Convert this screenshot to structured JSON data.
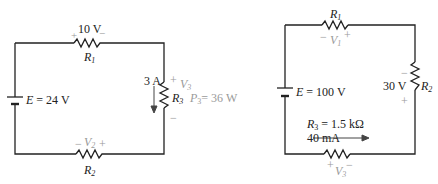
{
  "colors": {
    "wire": "#222222",
    "annotation": "#9a9a9a"
  },
  "circuit_a": {
    "source": {
      "label": "E = 24 V"
    },
    "r1": {
      "name": "R",
      "sub": "1",
      "voltage": "10 V",
      "plus": "+",
      "minus": "−"
    },
    "r2": {
      "name": "R",
      "sub": "2",
      "v_name": "V",
      "v_sub": "2",
      "plus": "+",
      "minus": "−"
    },
    "r3": {
      "name": "R",
      "sub": "3",
      "current": "3 A",
      "v_name": "V",
      "v_sub": "3",
      "plus": "+",
      "minus": "−",
      "p_name": "P",
      "p_sub": "3",
      "p_value": "= 36 W"
    }
  },
  "circuit_b": {
    "source": {
      "label": "E = 100 V"
    },
    "r1": {
      "name": "R",
      "sub": "1",
      "v_name": "V",
      "v_sub": "1",
      "plus": "+",
      "minus": "−"
    },
    "r2": {
      "name": "R",
      "sub": "2",
      "voltage": "30 V",
      "plus": "+",
      "minus": "−"
    },
    "r3": {
      "name": "R",
      "sub": "3",
      "value": "= 1.5 kΩ",
      "current": "40 mA",
      "v_name": "V",
      "v_sub": "3",
      "plus": "+",
      "minus": "−"
    }
  }
}
